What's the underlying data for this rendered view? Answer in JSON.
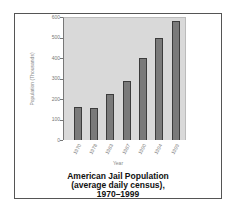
{
  "chart_data": {
    "type": "bar",
    "title": "American Jail Population (average daily census), 1970–1999",
    "title_lines": [
      "American Jail Population",
      "(average daily census),",
      "1970–1999"
    ],
    "xlabel": "Year",
    "ylabel": "Population (Thousands)",
    "categories": [
      "1970",
      "1978",
      "1983",
      "1987",
      "1990",
      "1994",
      "1999"
    ],
    "values": [
      160,
      158,
      223,
      290,
      400,
      500,
      580
    ],
    "ylim": [
      0,
      600
    ],
    "yticks": [
      0,
      100,
      200,
      300,
      400,
      500,
      600
    ],
    "grid": false,
    "legend": null,
    "colors": {
      "bar": "#7a7a7a",
      "bar_edge": "#3c3c3c",
      "plot_bg": "#d9d9d9"
    }
  }
}
